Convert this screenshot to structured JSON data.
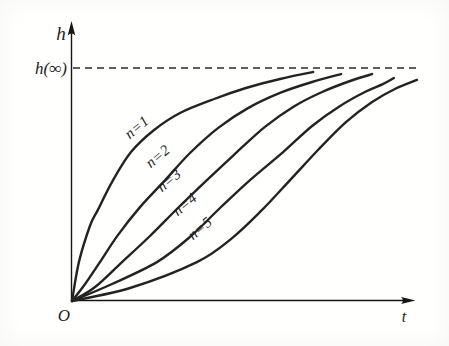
{
  "figure": {
    "ink_color": "#232323",
    "axis_color": "#161616",
    "dash_color": "#2b2b2b",
    "background_color": "#fffffe"
  },
  "chart_data": {
    "type": "line",
    "title": "",
    "xlabel": "t",
    "ylabel": "h",
    "origin_label": "O",
    "asymptote": {
      "label": "h(∞)",
      "value": 1.0,
      "style": "dashed-horizontal"
    },
    "x_range": [
      0,
      1
    ],
    "y_range": [
      0,
      1.15
    ],
    "grid": false,
    "legend_position": "labels-along-curves",
    "series": [
      {
        "name": "n=1",
        "points": [
          [
            0,
            0
          ],
          [
            0.02,
            0.167
          ],
          [
            0.052,
            0.322
          ],
          [
            0.075,
            0.391
          ],
          [
            0.119,
            0.519
          ],
          [
            0.171,
            0.639
          ],
          [
            0.238,
            0.734
          ],
          [
            0.313,
            0.807
          ],
          [
            0.412,
            0.867
          ],
          [
            0.504,
            0.914
          ],
          [
            0.603,
            0.953
          ],
          [
            0.699,
            0.983
          ]
        ],
        "label_pos": [
          0.197,
          0.73
        ]
      },
      {
        "name": "n=2",
        "points": [
          [
            0,
            0
          ],
          [
            0.038,
            0.073
          ],
          [
            0.081,
            0.167
          ],
          [
            0.133,
            0.283
          ],
          [
            0.197,
            0.403
          ],
          [
            0.27,
            0.519
          ],
          [
            0.342,
            0.635
          ],
          [
            0.423,
            0.742
          ],
          [
            0.51,
            0.828
          ],
          [
            0.603,
            0.893
          ],
          [
            0.696,
            0.94
          ],
          [
            0.78,
            0.974
          ]
        ],
        "label_pos": [
          0.258,
          0.605
        ]
      },
      {
        "name": "n=3",
        "points": [
          [
            0,
            0
          ],
          [
            0.067,
            0.06
          ],
          [
            0.145,
            0.167
          ],
          [
            0.226,
            0.279
          ],
          [
            0.307,
            0.399
          ],
          [
            0.391,
            0.519
          ],
          [
            0.478,
            0.639
          ],
          [
            0.559,
            0.747
          ],
          [
            0.641,
            0.833
          ],
          [
            0.725,
            0.897
          ],
          [
            0.806,
            0.944
          ],
          [
            0.87,
            0.974
          ]
        ],
        "label_pos": [
          0.29,
          0.502
        ]
      },
      {
        "name": "n=4",
        "points": [
          [
            0,
            0
          ],
          [
            0.116,
            0.073
          ],
          [
            0.246,
            0.167
          ],
          [
            0.342,
            0.275
          ],
          [
            0.429,
            0.399
          ],
          [
            0.516,
            0.519
          ],
          [
            0.612,
            0.639
          ],
          [
            0.696,
            0.751
          ],
          [
            0.777,
            0.837
          ],
          [
            0.849,
            0.897
          ],
          [
            0.901,
            0.931
          ],
          [
            0.933,
            0.957
          ]
        ],
        "label_pos": [
          0.336,
          0.399
        ]
      },
      {
        "name": "n=5",
        "points": [
          [
            0,
            0
          ],
          [
            0.168,
            0.056
          ],
          [
            0.362,
            0.167
          ],
          [
            0.464,
            0.27
          ],
          [
            0.551,
            0.391
          ],
          [
            0.632,
            0.519
          ],
          [
            0.713,
            0.648
          ],
          [
            0.794,
            0.768
          ],
          [
            0.87,
            0.854
          ],
          [
            0.936,
            0.91
          ],
          [
            1.0,
            0.949
          ]
        ],
        "label_pos": [
          0.38,
          0.296
        ]
      }
    ]
  },
  "layout": {
    "origin_px": [
      72,
      301
    ],
    "x_span_px": 345,
    "y_span_px": 233,
    "asymptote_y_px": 68,
    "curve_stroke_width": 2.4,
    "label_angle_deg": -40
  }
}
